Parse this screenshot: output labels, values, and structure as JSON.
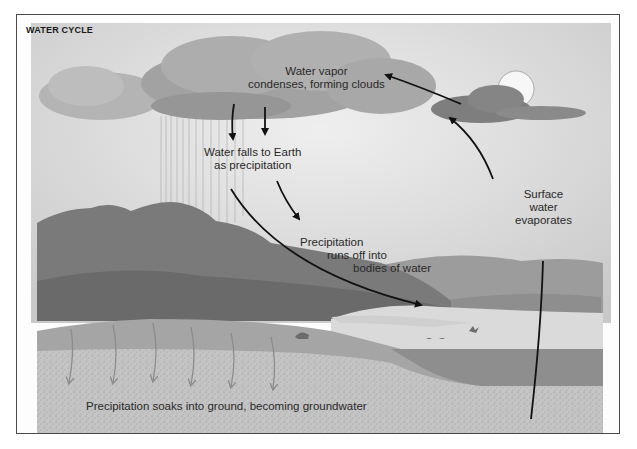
{
  "diagram": {
    "title": "WATER CYCLE",
    "labels": {
      "condensation": [
        "Water vapor",
        "condenses, forming clouds"
      ],
      "precipitation": [
        "Water falls to Earth",
        "as precipitation"
      ],
      "runoff": [
        "Precipitation",
        "runs off into",
        "bodies of water"
      ],
      "evaporation": [
        "Surface",
        "water",
        "evaporates"
      ],
      "groundwater": "Precipitation soaks into ground, becoming groundwater"
    },
    "stages": [
      "evaporation",
      "condensation",
      "precipitation",
      "runoff",
      "infiltration"
    ],
    "colors": {
      "sky": "#d9d9d9",
      "cloud_dark": "#8a8a8a",
      "hills": "#7a7a7a",
      "water": "#9a9a9a",
      "ground": "#b8b8b8",
      "arrow": "#111111",
      "groundwater_arrow": "#8c8c8c"
    }
  }
}
